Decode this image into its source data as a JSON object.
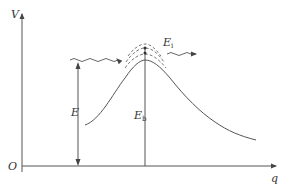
{
  "diagram": {
    "type": "potential-energy-barrier",
    "axes": {
      "y_label": "V",
      "x_label": "q",
      "origin_label": "O"
    },
    "labels": {
      "incident_energy": {
        "main": "E",
        "sub": ""
      },
      "barrier_height": {
        "main": "E",
        "sub": "b"
      },
      "tunneling_level": {
        "main": "E",
        "sub": "i"
      }
    },
    "elements": [
      "potential energy curve (single barrier peak)",
      "incident wave (wavy arrow from left)",
      "transmitted wave (wavy arrow to right)",
      "dashed energy levels near barrier top",
      "vertical double-headed arrow E from axis to incident wave",
      "vertical line E_b from axis to barrier peak"
    ],
    "colors": {
      "line": "#555555",
      "text": "#333333"
    }
  }
}
